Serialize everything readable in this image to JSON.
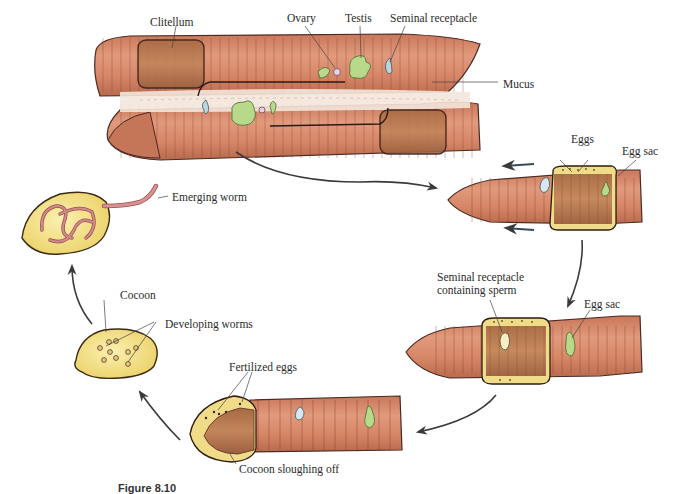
{
  "figure": {
    "caption_fragment": "Figure 8.10",
    "stages": [
      {
        "id": "mating",
        "labels": [
          "Clitellum",
          "Ovary",
          "Testis",
          "Seminal receptacle",
          "Mucus"
        ]
      },
      {
        "id": "egg-collection",
        "labels": [
          "Eggs",
          "Egg sac"
        ]
      },
      {
        "id": "sperm-collection",
        "labels": [
          "Seminal receptacle containing sperm",
          "Egg sac"
        ]
      },
      {
        "id": "fertilization",
        "labels": [
          "Fertilized eggs",
          "Cocoon sloughing off"
        ]
      },
      {
        "id": "cocoon",
        "labels": [
          "Cocoon",
          "Developing worms"
        ]
      },
      {
        "id": "hatching",
        "labels": [
          "Emerging worm"
        ]
      }
    ]
  },
  "labels": {
    "clitellum": "Clitellum",
    "ovary": "Ovary",
    "testis": "Testis",
    "seminal_receptacle": "Seminal receptacle",
    "mucus": "Mucus",
    "eggs": "Eggs",
    "egg_sac_1": "Egg sac",
    "seminal_receptacle_sperm_1": "Seminal receptacle",
    "seminal_receptacle_sperm_2": "containing sperm",
    "egg_sac_2": "Egg sac",
    "fertilized_eggs": "Fertilized eggs",
    "cocoon_sloughing": "Cocoon sloughing off",
    "cocoon": "Cocoon",
    "developing_worms": "Developing worms",
    "emerging_worm": "Emerging worm"
  },
  "colors": {
    "worm_body": "#d98a6a",
    "worm_dark": "#b86848",
    "worm_outline": "#4a2a22",
    "clitellum": "#c07850",
    "cocoon_yellow": "#f3e08a",
    "ovary_green": "#b8d98a",
    "receptacle_blue": "#bcd6e0",
    "mucus": "#f4e8e0",
    "arrow": "#3a3a3a"
  }
}
